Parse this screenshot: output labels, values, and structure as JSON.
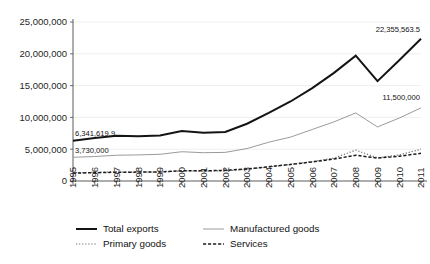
{
  "chart_data": {
    "type": "line",
    "title": "",
    "subtitle": "",
    "xlabel": "",
    "ylabel": "",
    "grid": "horizontal",
    "legend_position": "bottom",
    "xlim": [
      1995,
      2011
    ],
    "ylim": [
      0,
      25000000
    ],
    "categories": [
      1995,
      1996,
      1997,
      1998,
      1999,
      2000,
      2001,
      2002,
      2003,
      2004,
      2005,
      2006,
      2007,
      2008,
      2009,
      2010,
      2011
    ],
    "x": [
      "1995",
      "1996",
      "1997",
      "1998",
      "1999",
      "2000",
      "2001",
      "2002",
      "2003",
      "2004",
      "2005",
      "2006",
      "2007",
      "2008",
      "2009",
      "2010",
      "2011"
    ],
    "ytick_labels": [
      "0",
      "5,000,000",
      "10,000,000",
      "15,000,000",
      "20,000,000",
      "25,000,000"
    ],
    "ytick_values": [
      0,
      5000000,
      10000000,
      15000000,
      20000000,
      25000000
    ],
    "series": [
      {
        "name": "Total exports",
        "style": "solid-thick",
        "color": "#141414",
        "width": 2.0,
        "values": [
          6341619.9,
          6750000,
          7100000,
          7050000,
          7150000,
          7850000,
          7600000,
          7700000,
          9000000,
          10700000,
          12500000,
          14600000,
          17000000,
          19700000,
          15700000,
          19000000,
          22355563.5
        ]
      },
      {
        "name": "Manufactured goods",
        "style": "solid-thin",
        "color": "#9a9a9a",
        "width": 1.0,
        "values": [
          3730000,
          3850000,
          4050000,
          4100000,
          4200000,
          4600000,
          4450000,
          4500000,
          5100000,
          6100000,
          6900000,
          8100000,
          9300000,
          10700000,
          8500000,
          9900000,
          11500000
        ]
      },
      {
        "name": "Primary goods",
        "style": "dotted",
        "color": "#6f6f6f",
        "width": 1.2,
        "values": [
          1300000,
          1350000,
          1420000,
          1400000,
          1380000,
          1600000,
          1550000,
          1600000,
          1850000,
          2200000,
          2600000,
          3050000,
          3600000,
          4850000,
          3650000,
          4100000,
          5000000
        ]
      },
      {
        "name": "Services",
        "style": "dashed",
        "color": "#1c1c1c",
        "width": 1.5,
        "values": [
          1250000,
          1300000,
          1380000,
          1400000,
          1420000,
          1620000,
          1600000,
          1680000,
          1900000,
          2250000,
          2600000,
          3000000,
          3450000,
          4050000,
          3600000,
          3900000,
          4350000
        ]
      }
    ],
    "annotations": [
      {
        "text": "6,341,619.9",
        "series": "Total exports",
        "at_x": "1995",
        "value": 6341619.9
      },
      {
        "text": "22,355,563.5",
        "series": "Total exports",
        "at_x": "2011",
        "value": 22355563.5
      },
      {
        "text": "3,730,000",
        "series": "Manufactured goods",
        "at_x": "1995",
        "value": 3730000
      },
      {
        "text": "11,500,000",
        "series": "Manufactured goods",
        "at_x": "2011",
        "value": 11500000
      }
    ]
  },
  "legend": {
    "items": [
      {
        "label": "Total exports",
        "style": "solid-thick"
      },
      {
        "label": "Manufactured goods",
        "style": "solid-thin"
      },
      {
        "label": "Primary goods",
        "style": "dotted"
      },
      {
        "label": "Services",
        "style": "dashed"
      }
    ]
  }
}
